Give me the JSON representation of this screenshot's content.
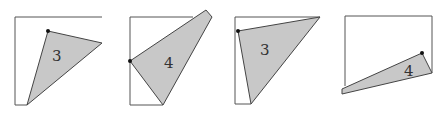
{
  "figure": {
    "panels": [
      {
        "label": "3",
        "square_edges": "M102,17 L15,17 L15,105 L27,105",
        "polygon": "48,31 102,43 27,105",
        "dot": [
          48,
          31
        ],
        "label_pos": [
          57,
          61
        ],
        "fill": "#c8c8c8"
      },
      {
        "label": "4",
        "square_edges": "M193,17 L130,17 L130,105 L163,105",
        "polygon": "130,61 206,10 212,17 163,105",
        "dot": [
          130,
          61
        ],
        "label_pos": [
          168,
          68
        ],
        "fill": "#c8c8c8"
      },
      {
        "label": "3",
        "square_edges": "M320,17 L235,17 L235,104 L251,104",
        "polygon": "238,31 320,17 251,104",
        "dot": [
          238,
          31
        ],
        "label_pos": [
          265,
          55
        ],
        "fill": "#c8c8c8"
      },
      {
        "label": "4",
        "square_edges": "M345,86 L345,16 L432,16 L432,73",
        "polygon": "422,53 432,73 342,94 342,89",
        "dot": [
          422,
          53
        ],
        "label_pos": [
          408,
          75
        ],
        "fill": "#c8c8c8"
      }
    ]
  }
}
